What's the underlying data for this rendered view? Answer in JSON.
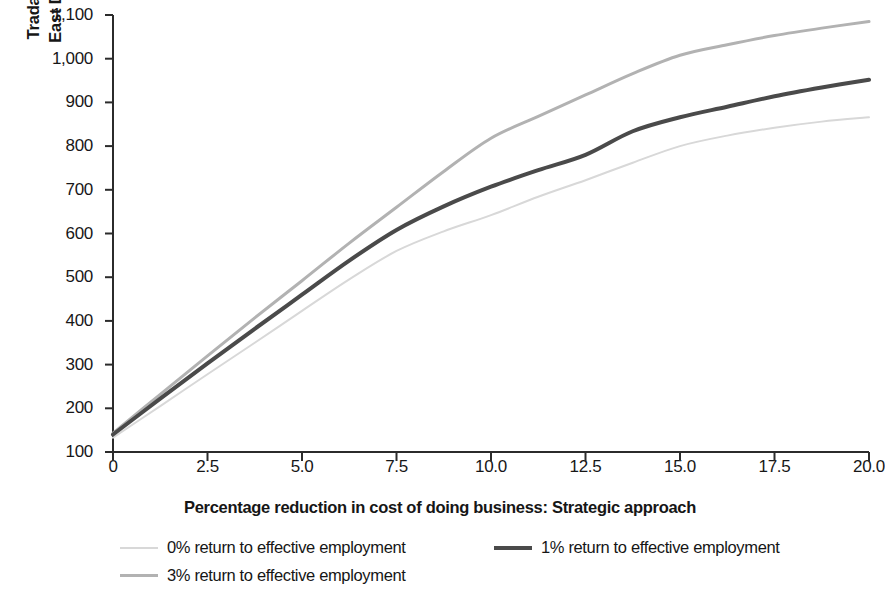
{
  "chart_data": {
    "type": "line",
    "title": "",
    "subtitle": "",
    "xlabel": "Percentage reduction in cost of doing business: Strategic approach",
    "ylabel": "Tradable services jobs,\nEast Dhaka (thousands)",
    "xlim": [
      0,
      20
    ],
    "ylim": [
      100,
      1100
    ],
    "grid": false,
    "legend_position": "bottom-left",
    "xticks": [
      "0",
      "2.5",
      "5.0",
      "7.5",
      "10.0",
      "12.5",
      "15.0",
      "17.5",
      "20.0"
    ],
    "xtick_values": [
      0,
      2.5,
      5.0,
      7.5,
      10.0,
      12.5,
      15.0,
      17.5,
      20.0
    ],
    "yticks": [
      "100",
      "200",
      "300",
      "400",
      "500",
      "600",
      "700",
      "800",
      "900",
      "1,000",
      "1,100"
    ],
    "ytick_values": [
      100,
      200,
      300,
      400,
      500,
      600,
      700,
      800,
      900,
      1000,
      1100
    ],
    "x": [
      0,
      1.25,
      2.5,
      3.75,
      5.0,
      6.25,
      7.5,
      8.75,
      10.0,
      11.25,
      12.5,
      13.75,
      15.0,
      16.25,
      17.5,
      18.75,
      20.0
    ],
    "series": [
      {
        "name": "0% return to effective employment",
        "color": "#d8d8d8",
        "width": 2,
        "values": [
          133,
          205,
          278,
          350,
          423,
          495,
          560,
          605,
          642,
          684,
          722,
          762,
          800,
          824,
          842,
          856,
          866
        ]
      },
      {
        "name": "1% return to effective employment",
        "color": "#4a4a4a",
        "width": 4,
        "values": [
          140,
          222,
          303,
          382,
          460,
          538,
          608,
          662,
          707,
          745,
          780,
          834,
          866,
          890,
          914,
          934,
          952
        ]
      },
      {
        "name": "3% return to effective employment",
        "color": "#b2b2b2",
        "width": 3,
        "values": [
          143,
          232,
          320,
          407,
          492,
          578,
          660,
          742,
          818,
          868,
          917,
          966,
          1008,
          1032,
          1053,
          1070,
          1085
        ]
      }
    ]
  },
  "legend": {
    "items": [
      {
        "label": "0% return to effective employment"
      },
      {
        "label": "1% return to effective employment"
      },
      {
        "label": "3% return to effective employment"
      }
    ]
  }
}
